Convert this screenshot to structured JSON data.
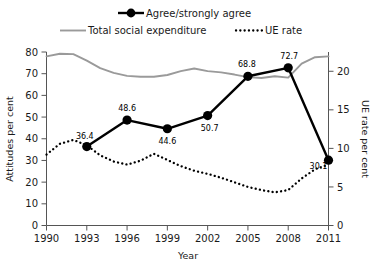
{
  "chart_data": {
    "type": "line",
    "title": "",
    "xlabel": "Year",
    "ylabel": "Attitudes per cent",
    "y2label": "UE rate per cent",
    "xlim": [
      1990,
      2011
    ],
    "ylim": [
      0,
      80
    ],
    "y2lim": [
      0,
      22.5
    ],
    "grid": false,
    "legend_position": "top",
    "xticks": [
      1990,
      1993,
      1996,
      1999,
      2002,
      2005,
      2008,
      2011
    ],
    "xticklabels": [
      "1990",
      "1993",
      "1996",
      "1999",
      "2002",
      "2005",
      "2008",
      "2011"
    ],
    "yticks": [
      0,
      10,
      20,
      30,
      40,
      50,
      60,
      70,
      80
    ],
    "yticklabels": [
      "0",
      "10",
      "20",
      "30",
      "40",
      "50",
      "60",
      "70",
      "80"
    ],
    "y2ticks": [
      0,
      5,
      10,
      15,
      20
    ],
    "y2ticklabels": [
      "0",
      "5",
      "10",
      "15",
      "20"
    ],
    "series": [
      {
        "name": "Agree/strongly agree",
        "axis": "left",
        "style": "solid-marker",
        "color": "#000000",
        "x": [
          1993,
          1996,
          1999,
          2002,
          2005,
          2008,
          2011
        ],
        "values": [
          36.4,
          48.6,
          44.6,
          50.7,
          68.8,
          72.7,
          30.1
        ],
        "labels": [
          "36.4",
          "48.6",
          "44.6",
          "50.7",
          "68.8",
          "72.7",
          "30.1"
        ]
      },
      {
        "name": "Total social expenditure",
        "axis": "left",
        "style": "solid",
        "color": "#9a9a9a",
        "x": [
          1990,
          1991,
          1992,
          1993,
          1994,
          1995,
          1996,
          1997,
          1998,
          1999,
          2000,
          2001,
          2002,
          2003,
          2004,
          2005,
          2006,
          2007,
          2008,
          2009,
          2010,
          2011
        ],
        "values": [
          78.0,
          79.2,
          79.0,
          76.0,
          72.6,
          70.4,
          69.0,
          68.6,
          68.6,
          69.4,
          71.2,
          72.4,
          71.2,
          70.6,
          69.6,
          68.4,
          68.0,
          68.8,
          68.2,
          74.6,
          77.6,
          78.0
        ]
      },
      {
        "name": "UE rate",
        "axis": "right",
        "style": "dotted",
        "color": "#000000",
        "x": [
          1990,
          1991,
          1992,
          1993,
          1994,
          1995,
          1996,
          1997,
          1998,
          1999,
          2000,
          2001,
          2002,
          2003,
          2004,
          2005,
          2006,
          2007,
          2008,
          2009,
          2010,
          2011
        ],
        "values": [
          9.2,
          10.6,
          11.1,
          10.4,
          9.1,
          8.3,
          7.9,
          8.4,
          9.3,
          8.5,
          7.7,
          7.1,
          6.7,
          6.2,
          5.6,
          5.0,
          4.6,
          4.3,
          4.6,
          6.1,
          7.3,
          7.9
        ]
      }
    ],
    "legend": [
      {
        "label": "Agree/strongly agree",
        "marker": "line-circle",
        "color": "#000000"
      },
      {
        "label": "Total social expenditure",
        "marker": "line",
        "color": "#9a9a9a"
      },
      {
        "label": "UE rate",
        "marker": "dotted",
        "color": "#000000"
      }
    ]
  }
}
